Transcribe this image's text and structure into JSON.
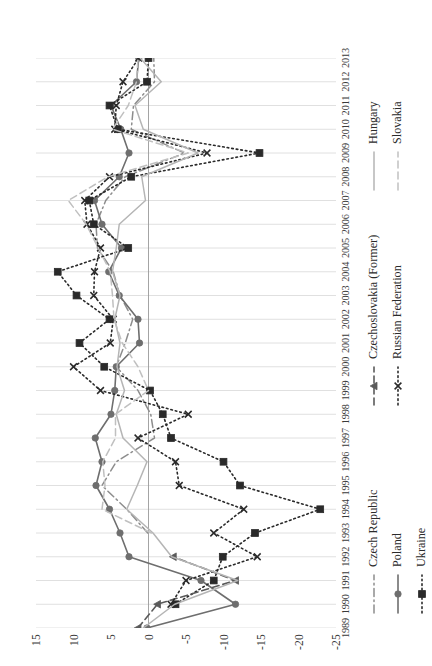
{
  "chart": {
    "type": "line",
    "title": "",
    "xlabel": "",
    "ylabel": "",
    "orientation": "rotated-90-ccw",
    "grid": "vertical-year-gridlines",
    "legend_position": "below-plot"
  },
  "axes": {
    "value_axis": {
      "ticks": [
        "15",
        "10",
        "5",
        "0",
        "-5",
        "-10",
        "-15",
        "-20",
        "-25"
      ],
      "min": -25,
      "max": 15,
      "step": 5
    },
    "year_axis": {
      "ticks": [
        "1989",
        "1990",
        "1991",
        "1992",
        "1993",
        "1994",
        "1995",
        "1996",
        "1997",
        "1998",
        "1999",
        "2000",
        "2001",
        "2002",
        "2003",
        "2004",
        "2005",
        "2006",
        "2007",
        "2008",
        "2009",
        "2010",
        "2011",
        "2012",
        "2013"
      ]
    }
  },
  "legend": {
    "columns": [
      {
        "items": [
          {
            "label": "Czech Republic",
            "style": "dashdot",
            "marker": "none",
            "color": "#8d8d8d"
          },
          {
            "label": "Poland",
            "style": "solid",
            "marker": "circle",
            "color": "#6e6e6e"
          },
          {
            "label": "Ukraine",
            "style": "dotted",
            "marker": "square",
            "color": "#2a2a2a"
          }
        ]
      },
      {
        "items": [
          {
            "label": "Czechoslovakia (Former)",
            "style": "dashed",
            "marker": "triangle",
            "color": "#5a5a5a"
          },
          {
            "label": "Russian Federation",
            "style": "dotted",
            "marker": "x",
            "color": "#2a2a2a"
          }
        ]
      },
      {
        "items": [
          {
            "label": "Hungary",
            "style": "solid",
            "marker": "none",
            "color": "#b5b5b5"
          },
          {
            "label": "Slovakia",
            "style": "dashed",
            "marker": "none",
            "color": "#c0c0c0"
          }
        ]
      }
    ]
  },
  "chart_data": {
    "type": "line",
    "title": "",
    "xlabel": "",
    "ylabel": "",
    "ylim": [
      -25,
      15
    ],
    "grid": true,
    "legend_position": "bottom",
    "x": [
      "1989",
      "1990",
      "1991",
      "1992",
      "1993",
      "1994",
      "1995",
      "1996",
      "1997",
      "1998",
      "1999",
      "2000",
      "2001",
      "2002",
      "2003",
      "2004",
      "2005",
      "2006",
      "2007",
      "2008",
      "2009",
      "2010",
      "2011",
      "2012",
      "2013"
    ],
    "series": [
      {
        "name": "Czech Republic",
        "color": "#8d8d8d",
        "style": "dashdot",
        "marker": "none",
        "values": [
          null,
          null,
          null,
          null,
          0.1,
          2.9,
          6.2,
          4.3,
          -0.8,
          -0.3,
          1.4,
          4.3,
          3.1,
          2.1,
          3.8,
          4.7,
          6.8,
          7.0,
          5.7,
          3.1,
          -4.8,
          2.3,
          2.0,
          -0.8,
          -0.7
        ]
      },
      {
        "name": "Poland",
        "color": "#6e6e6e",
        "style": "solid",
        "marker": "circle",
        "values": [
          0.2,
          -11.6,
          -7.0,
          2.6,
          3.8,
          5.2,
          7.0,
          6.2,
          7.1,
          5.0,
          4.5,
          4.3,
          1.2,
          1.4,
          3.9,
          5.3,
          3.6,
          6.2,
          7.2,
          3.9,
          2.6,
          3.7,
          5.0,
          1.6,
          1.3
        ]
      },
      {
        "name": "Ukraine",
        "color": "#2a2a2a",
        "style": "dotted",
        "marker": "square",
        "values": [
          null,
          -3.6,
          -8.7,
          -9.9,
          -14.2,
          -22.9,
          -12.2,
          -10.0,
          -3.0,
          -1.9,
          -0.2,
          5.9,
          9.2,
          5.2,
          9.6,
          12.1,
          2.7,
          7.3,
          7.9,
          2.3,
          -14.8,
          4.1,
          5.2,
          0.2,
          0.0
        ]
      },
      {
        "name": "Czechoslovakia (Former)",
        "color": "#5a5a5a",
        "style": "dashed",
        "marker": "triangle",
        "values": [
          1.4,
          -1.2,
          -11.6,
          -3.3,
          null,
          null,
          null,
          null,
          null,
          null,
          null,
          null,
          null,
          null,
          null,
          null,
          null,
          null,
          null,
          null,
          null,
          null,
          null,
          null,
          null
        ]
      },
      {
        "name": "Russian Federation",
        "color": "#2a2a2a",
        "style": "dotted",
        "marker": "x",
        "values": [
          null,
          -3.0,
          -5.0,
          -14.5,
          -8.7,
          -12.7,
          -4.1,
          -3.6,
          1.4,
          -5.3,
          6.4,
          10.0,
          5.1,
          4.7,
          7.3,
          7.2,
          6.4,
          8.2,
          8.5,
          5.2,
          -7.8,
          4.5,
          4.3,
          3.4,
          1.3
        ]
      },
      {
        "name": "Hungary",
        "color": "#b5b5b5",
        "style": "solid",
        "marker": "none",
        "values": [
          0.7,
          -3.5,
          -11.9,
          -3.1,
          -0.6,
          2.9,
          1.5,
          0.2,
          3.4,
          4.3,
          3.2,
          4.2,
          3.8,
          4.5,
          3.8,
          4.8,
          4.3,
          3.9,
          0.4,
          0.9,
          -6.6,
          0.7,
          1.8,
          -1.7,
          1.1
        ]
      },
      {
        "name": "Slovakia",
        "color": "#c0c0c0",
        "style": "dashed",
        "marker": "none",
        "values": [
          null,
          null,
          null,
          null,
          -0.4,
          6.2,
          5.8,
          6.1,
          4.4,
          4.4,
          0.0,
          1.4,
          3.5,
          4.6,
          4.8,
          5.1,
          6.7,
          8.3,
          10.7,
          5.4,
          -5.3,
          4.8,
          2.7,
          1.6,
          1.4
        ]
      }
    ]
  }
}
